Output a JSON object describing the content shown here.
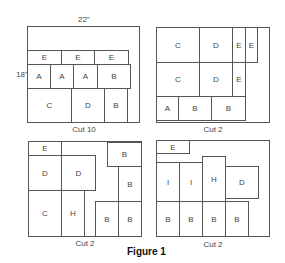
{
  "figure": {
    "caption": "Figure 1",
    "board_width_label": "22\"",
    "board_height_label": "18\"",
    "panels": [
      {
        "cut_label": "Cut 10",
        "pieces": [
          "E",
          "E",
          "E",
          "A",
          "A",
          "A",
          "B",
          "C",
          "D",
          "B"
        ]
      },
      {
        "cut_label": "Cut 2",
        "pieces": [
          "C",
          "D",
          "E",
          "E",
          "C",
          "D",
          "E",
          "A",
          "B",
          "B"
        ]
      },
      {
        "cut_label": "Cut 2",
        "pieces": [
          "E",
          "D",
          "D",
          "C",
          "H",
          "B",
          "B",
          "B",
          "B"
        ]
      },
      {
        "cut_label": "Cut 2",
        "pieces": [
          "E",
          "I",
          "I",
          "H",
          "D",
          "B",
          "B",
          "B",
          "B"
        ]
      }
    ]
  }
}
